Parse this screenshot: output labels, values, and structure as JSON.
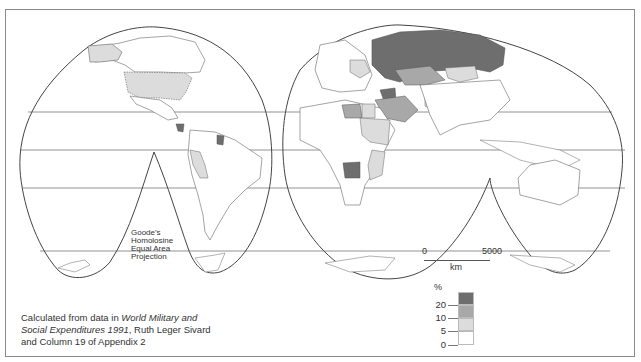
{
  "map": {
    "projection_label": [
      "Goode's",
      "Homolosine",
      "Equal Area",
      "Projection"
    ],
    "source": {
      "prefix": "Calculated from data in ",
      "title_italic_1": "World Military and",
      "title_italic_2": "Social Expenditures 1991",
      "suffix_line2": ", Ruth Leger Sivard",
      "line3": "and Column 19 of Appendix 2"
    },
    "scale_bar": {
      "start": "0",
      "end": "5000",
      "unit": "km"
    },
    "legend": {
      "unit": "%",
      "ticks": [
        "20",
        "10",
        "5",
        "0"
      ],
      "classes": [
        {
          "range": ">20",
          "color": "#6e6e6e"
        },
        {
          "range": "10-20",
          "color": "#a8a8a8"
        },
        {
          "range": "5-10",
          "color": "#dcdcdc"
        },
        {
          "range": "0-5",
          "color": "#ffffff"
        }
      ]
    },
    "colors": {
      "frame": "#8a8a8a",
      "outline": "#444444",
      "dark": "#6e6e6e",
      "medium": "#a8a8a8",
      "light": "#dcdcdc"
    }
  }
}
